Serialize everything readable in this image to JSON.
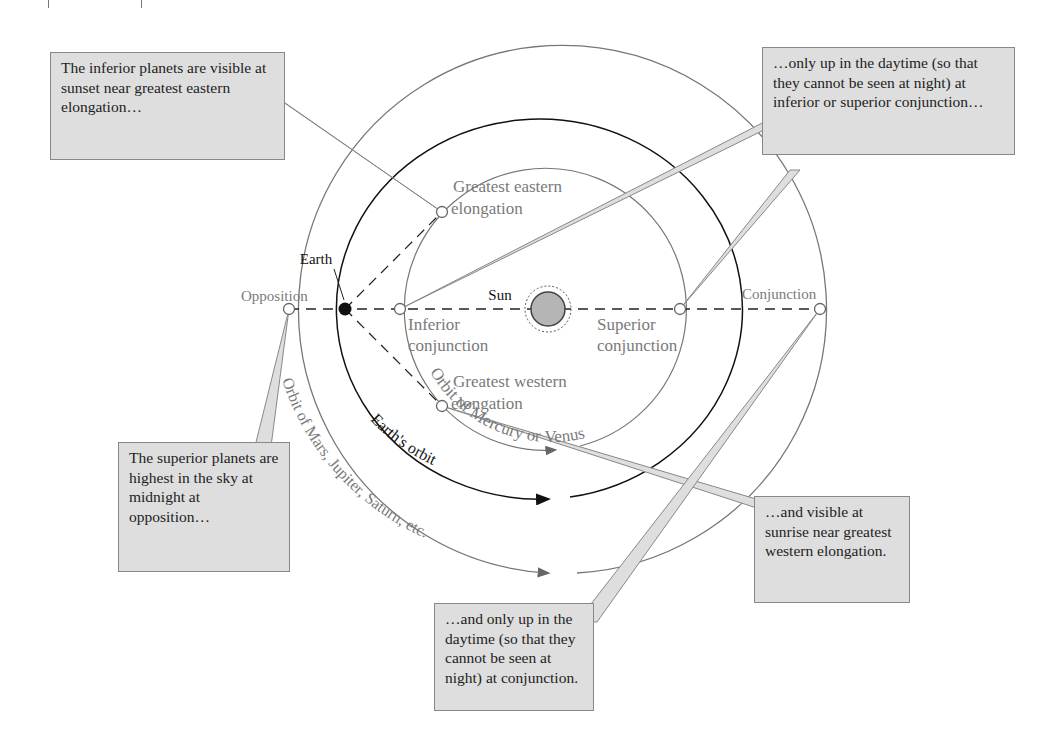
{
  "diagram": {
    "type": "planetary-configurations",
    "labels": {
      "earth": "Earth",
      "sun": "Sun",
      "opposition": "Opposition",
      "conjunction": "Conjunction",
      "inferior_conjunction_1": "Inferior",
      "inferior_conjunction_2": "conjunction",
      "superior_conjunction_1": "Superior",
      "superior_conjunction_2": "conjunction",
      "greatest_eastern_1": "Greatest eastern",
      "greatest_eastern_2": "elongation",
      "greatest_western_1": "Greatest western",
      "greatest_western_2": "elongation",
      "orbit_inner": "Orbit of Mercury or Venus",
      "orbit_earth": "Earth's orbit",
      "orbit_outer": "Orbit of Mars, Jupiter, Saturn, etc."
    },
    "callouts": {
      "eastern_elongation": "The inferior planets are visible at sunset near greatest eastern elongation…",
      "inferior_superior_conjunction": "…only up in the daytime (so that they cannot be seen at night) at inferior or superior conjunction…",
      "opposition": "The superior planets are highest in the sky at midnight at opposition…",
      "western_elongation": "…and visible at sunrise near greatest western elongation.",
      "conjunction": "…and only up in the daytime (so that they cannot be seen at night) at conjunction."
    },
    "colors": {
      "callout_fill": "#dedede",
      "callout_border": "#888888",
      "orbit_gray": "#777777",
      "orbit_earth": "#111111",
      "label_gray": "#7a7a7a",
      "sun_fill": "#b5b5b5"
    }
  }
}
